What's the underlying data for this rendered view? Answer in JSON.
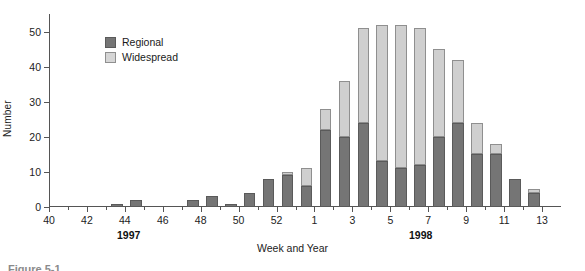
{
  "chart_data": {
    "type": "bar",
    "subtype": "stacked-bar",
    "title": "",
    "xlabel": "Week and Year",
    "ylabel": "Number",
    "ylim": [
      0,
      55
    ],
    "yticks": [
      0,
      10,
      20,
      30,
      40,
      50
    ],
    "ytick_labels": [
      "0",
      "10",
      "20",
      "30",
      "40",
      "50"
    ],
    "grid": false,
    "legend_position": "upper-left-inside",
    "x": [
      "40",
      "41",
      "42",
      "43",
      "44",
      "45",
      "46",
      "47",
      "48",
      "49",
      "50",
      "51",
      "52",
      "53",
      "1",
      "2",
      "3",
      "4",
      "5",
      "6",
      "7",
      "8",
      "9",
      "10",
      "11",
      "12"
    ],
    "xtick_labels": [
      "40",
      "42",
      "44",
      "46",
      "48",
      "50",
      "52",
      "1",
      "3",
      "5",
      "7",
      "9",
      "11",
      "13"
    ],
    "categories": [
      "40",
      "41",
      "42",
      "43",
      "44",
      "45",
      "46",
      "47",
      "48",
      "49",
      "50",
      "51",
      "52",
      "53",
      "1",
      "2",
      "3",
      "4",
      "5",
      "6",
      "7",
      "8",
      "9",
      "10",
      "11",
      "12"
    ],
    "series": [
      {
        "name": "Regional",
        "color": "#757575",
        "values": [
          0,
          0,
          0,
          1,
          2,
          0,
          0,
          2,
          3,
          1,
          4,
          8,
          9,
          6,
          22,
          20,
          24,
          13,
          11,
          12,
          20,
          24,
          15,
          15,
          8,
          4
        ]
      },
      {
        "name": "Widespread",
        "color": "#d6d6d6",
        "values": [
          0,
          0,
          0,
          0,
          0,
          0,
          0,
          0,
          0,
          0,
          0,
          0,
          1,
          5,
          6,
          16,
          27,
          39,
          41,
          39,
          25,
          18,
          9,
          3,
          0,
          1
        ]
      }
    ],
    "totals": [
      0,
      0,
      0,
      1,
      2,
      0,
      0,
      2,
      3,
      1,
      4,
      8,
      10,
      11,
      28,
      36,
      51,
      52,
      52,
      51,
      45,
      42,
      24,
      18,
      8,
      5
    ],
    "year_bands": [
      {
        "label": "1997",
        "start": "40",
        "end": "53"
      },
      {
        "label": "1998",
        "start": "1",
        "end": "12"
      }
    ]
  },
  "legend": {
    "items": [
      {
        "label": "Regional",
        "swatch": "regional-swatch"
      },
      {
        "label": "Widespread",
        "swatch": "widespread-swatch"
      }
    ]
  },
  "axes": {
    "y_title": "Number",
    "x_title": "Week and Year",
    "y_tick_labels": [
      "0",
      "10",
      "20",
      "30",
      "40",
      "50"
    ],
    "x_tick_labels": [
      "40",
      "42",
      "44",
      "46",
      "48",
      "50",
      "52",
      "1",
      "3",
      "5",
      "7",
      "9",
      "11",
      "13"
    ]
  },
  "year_labels": {
    "first": "1997",
    "second": "1998"
  },
  "caption": {
    "clipped_text": "Figure 5-1"
  },
  "colors": {
    "regional": "#757575",
    "widespread": "#d6d6d6",
    "axis": "#555555",
    "text": "#1a1a1a",
    "background": "#ffffff"
  }
}
